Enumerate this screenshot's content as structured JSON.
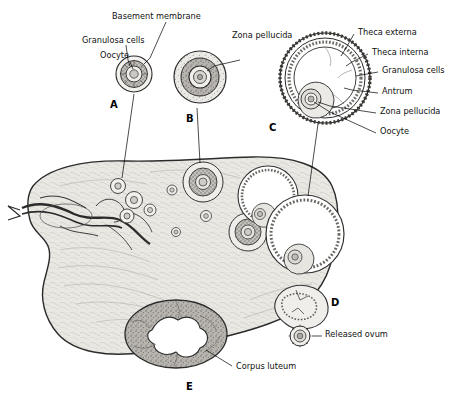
{
  "figure": {
    "labels": {
      "basement_membrane": "Basement membrane",
      "granulosa_cells_a": "Granulosa cells",
      "oocyte_a": "Oocyte",
      "zona_pellucida_b": "Zona pellucida",
      "theca_externa": "Theca externa",
      "theca_interna": "Theca interna",
      "granulosa_cells_c": "Granulosa cells",
      "antrum": "Antrum",
      "zona_pellucida_c": "Zona pellucida",
      "oocyte_c": "Oocyte",
      "released_ovum": "Released ovum",
      "corpus_luteum": "Corpus luteum"
    },
    "stages": [
      {
        "id": "A",
        "letter": "A"
      },
      {
        "id": "B",
        "letter": "B"
      },
      {
        "id": "C",
        "letter": "C"
      },
      {
        "id": "D",
        "letter": "D"
      },
      {
        "id": "E",
        "letter": "E"
      }
    ],
    "colors": {
      "outline": "#1a1a1a",
      "ovary_fill": "#e8e6e1",
      "ovary_stroke": "#2b2b2b",
      "follicle_fill": "#f2f0ec",
      "granulosa_fill": "#b9b6b1",
      "antrum_fill": "#ffffff",
      "corpus_luteum_fill": "#9d9a95",
      "leader_line": "#000000",
      "text": "#111111"
    }
  }
}
